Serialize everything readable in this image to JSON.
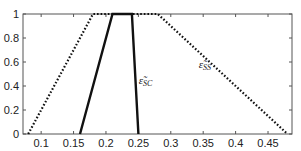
{
  "chart_data": {
    "type": "line",
    "title": "",
    "xlabel": "",
    "ylabel": "",
    "xlim": [
      0.072,
      0.487
    ],
    "ylim": [
      0,
      1
    ],
    "grid": false,
    "legend": "none (inline labels)",
    "x_ticks": [
      "0.1",
      "0.15",
      "0.2",
      "0.25",
      "0.3",
      "0.35",
      "0.4",
      "0.45"
    ],
    "x_tick_values": [
      0.1,
      0.15,
      0.2,
      0.25,
      0.3,
      0.35,
      0.4,
      0.45
    ],
    "y_ticks": [
      "0",
      "0.2",
      "0.4",
      "0.6",
      "0.8",
      "1"
    ],
    "y_tick_values": [
      0,
      0.2,
      0.4,
      0.6,
      0.8,
      1
    ],
    "series": [
      {
        "name": "ε̃_SC",
        "label_main": "ε̃",
        "label_sub": "SC",
        "style": "solid",
        "color": "#111111",
        "x": [
          0.16,
          0.21,
          0.24,
          0.25
        ],
        "y": [
          0,
          1,
          1,
          0
        ],
        "label_pos": [
          0.2505,
          0.42
        ]
      },
      {
        "name": "ε̃_SS",
        "label_main": "ε̃",
        "label_sub": "SS",
        "style": "dotted",
        "color": "#111111",
        "x": [
          0.08,
          0.18,
          0.28,
          0.48
        ],
        "y": [
          0,
          1,
          1,
          0
        ],
        "label_pos": [
          0.343,
          0.55
        ]
      }
    ]
  }
}
